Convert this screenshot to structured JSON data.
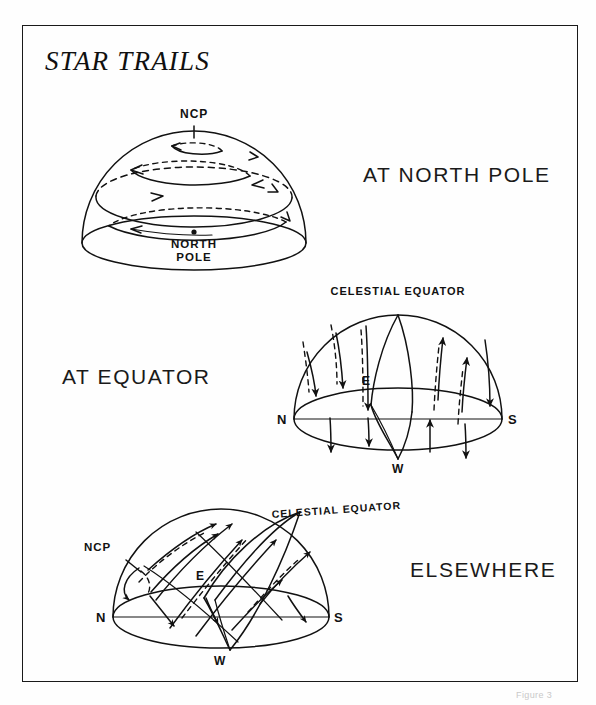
{
  "figure": {
    "title": "STAR TRAILS",
    "caption": "Figure 3",
    "background_color": "#ffffff",
    "ink_color": "#111111",
    "frame": {
      "x": 22,
      "y": 25,
      "width": 556,
      "height": 657
    }
  },
  "panels": [
    {
      "id": "north-pole",
      "caption": "AT NORTH POLE",
      "labels": {
        "pole_axis": "NCP",
        "observer_line1": "NORTH",
        "observer_line2": "POLE"
      },
      "description": "Celestial dome seen from the North Pole; star trails are concentric circles centered on the North Celestial Pole at the zenith, none rise or set."
    },
    {
      "id": "equator",
      "caption": "AT EQUATOR",
      "labels": {
        "great_circle": "CELESTIAL EQUATOR",
        "north": "N",
        "south": "S",
        "east": "E",
        "west": "W"
      },
      "description": "Celestial dome seen from the equator; star trails are vertical, rising straight up in the east and setting straight down in the west."
    },
    {
      "id": "elsewhere",
      "caption": "ELSEWHERE",
      "labels": {
        "pole": "NCP",
        "great_circle": "CELESTIAL EQUATOR",
        "north": "N",
        "south": "S",
        "east": "E",
        "west": "W"
      },
      "description": "Celestial dome seen from mid-latitude; star trails are tilted arcs, circumpolar near the NCP and rising at an angle in the east."
    }
  ]
}
